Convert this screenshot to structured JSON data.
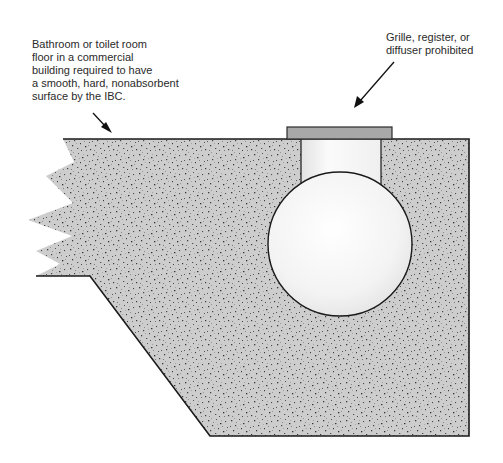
{
  "diagram": {
    "labels": {
      "floor": {
        "lines": [
          "Bathroom or toilet room",
          "floor in a commercial",
          "building required to have",
          "a smooth, hard, nonabsorbent",
          "surface by the IBC."
        ]
      },
      "grille": {
        "lines": [
          "Grille, register, or",
          "diffuser prohibited"
        ]
      }
    },
    "components": {
      "slab": "concrete-floor-slab",
      "grille": "grille-register-diffuser",
      "duct_riser": "duct-riser",
      "duct": "round-duct"
    },
    "colors": {
      "concrete_base": "#c8c8c8",
      "concrete_speckle": "#3a3a3a",
      "outline": "#1a1a1a",
      "grille": "#a8a8a8",
      "duct_fill": "#f4f4f4",
      "text": "#2a2a2a"
    }
  }
}
